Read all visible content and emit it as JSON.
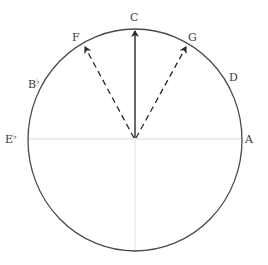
{
  "diagram": {
    "type": "pitch-circle",
    "center": [
      135,
      140
    ],
    "radius_x": 107,
    "radius_y": 111,
    "colors": {
      "circle": "#4a4a4a",
      "axis": "#d8d8d8",
      "arrow": "#2a2a2a",
      "label": "#3a3a3a"
    },
    "labels": [
      {
        "id": "C",
        "text": "C",
        "x": 130,
        "y": 12
      },
      {
        "id": "F",
        "text": "F",
        "x": 72,
        "y": 32
      },
      {
        "id": "G",
        "text": "G",
        "x": 188,
        "y": 32
      },
      {
        "id": "D",
        "text": "D",
        "x": 229,
        "y": 72
      },
      {
        "id": "Bb",
        "text": "B",
        "accidental": "♭",
        "x": 28,
        "y": 79
      },
      {
        "id": "Eb",
        "text": "E",
        "accidental": "♭",
        "x": 5,
        "y": 134
      },
      {
        "id": "A",
        "text": "A",
        "x": 245,
        "y": 134
      }
    ],
    "arrows": [
      {
        "to": "C",
        "style": "solid",
        "tip": [
          135,
          30
        ]
      },
      {
        "to": "F",
        "style": "dashed",
        "tip": [
          84,
          46
        ]
      },
      {
        "to": "G",
        "style": "dashed",
        "tip": [
          187,
          46
        ]
      }
    ],
    "axes": {
      "horizontal": {
        "y": 139,
        "x1": 28,
        "x2": 242
      },
      "vertical": {
        "x": 135,
        "y1": 140,
        "y2": 251
      }
    }
  }
}
